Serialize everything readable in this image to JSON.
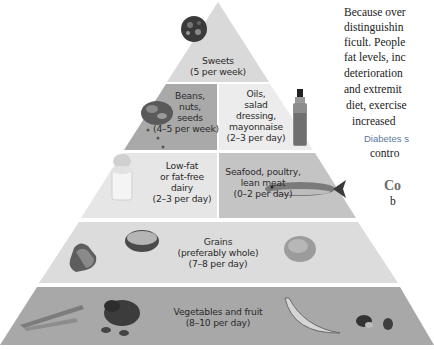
{
  "pyramid": {
    "layers": [
      {
        "id": "sweets",
        "lines": [
          "Sweets",
          "(5 per week)"
        ]
      },
      {
        "id": "beans",
        "lines": [
          "Beans,",
          "nuts,",
          "seeds",
          "(4–5 per week)"
        ]
      },
      {
        "id": "oils",
        "lines": [
          "Oils,",
          "salad",
          "dressing,",
          "mayonnaise",
          "(2–3 per day)"
        ]
      },
      {
        "id": "dairy",
        "lines": [
          "Low-fat",
          "or fat-free",
          "dairy",
          "(2–3 per day)"
        ]
      },
      {
        "id": "seafood",
        "lines": [
          "Seafood, poultry,",
          "lean meat",
          "(0–2 per day)"
        ]
      },
      {
        "id": "grains",
        "lines": [
          "Grains",
          "(preferably whole)",
          "(7–8 per day)"
        ]
      },
      {
        "id": "vegetables",
        "lines": [
          "Vegetables and fruit",
          "(8–10 per day)"
        ]
      }
    ],
    "colors": {
      "sweets": "#d9d9d9",
      "beans": "#a9a9a9",
      "oils": "#ececec",
      "dairy": "#e6e6e6",
      "seafood": "#c4c4c4",
      "grains": "#dcdcdc",
      "vegetables": "#a8a8a8"
    }
  },
  "side_text": {
    "lines": [
      "Because over",
      "distinguishin",
      "ficult. People",
      "fat levels, inc",
      "deterioration",
      "and extremit",
      "diet, exercise",
      "increased",
      "Diabetes s",
      "contro",
      "Co",
      "b"
    ]
  }
}
